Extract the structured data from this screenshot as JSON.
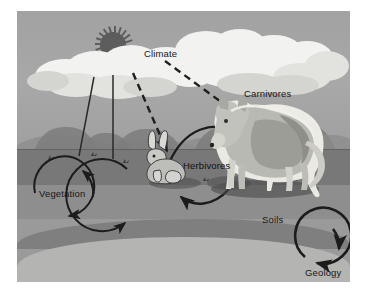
{
  "figure": {
    "background_color": "#ffffff",
    "plate_color": "#9a9a9a"
  },
  "scene": {
    "sky_color": "#a4a4a4",
    "cloud_color": "#f2f2f0",
    "sun_color": "#5a5a5a",
    "arrow_color": "#1c1c1c",
    "strata": [
      {
        "name": "topsoil",
        "color": "#787878"
      },
      {
        "name": "subsoil",
        "color": "#8e8e8e"
      },
      {
        "name": "deep-soil",
        "color": "#7f7f7f"
      },
      {
        "name": "bedrock",
        "color": "#b4b4b2"
      }
    ]
  },
  "labels": {
    "climate": "Climate",
    "carnivores": "Carnivores",
    "herbivores": "Herbivores",
    "vegetation": "Vegetation",
    "soils": "Soils",
    "geology": "Geology"
  },
  "elements": {
    "sun": "sun-icon",
    "cloud": "cloud-icon",
    "wolf": "wolf-icon",
    "rabbit": "rabbit-icon",
    "shrubs": "shrub-icon",
    "vegetation_cycle_arrow": "circular-arrow-icon",
    "herbivore_cycle_arrow": "circular-arrow-icon",
    "geology_cycle_arrow": "circular-arrow-icon",
    "climate_dashed_arrows": "dashed-arrow-icon",
    "rainfall_lines": "vertical-line-icon",
    "food_chain_arrow": "curved-arrow-icon",
    "decomposition_arrow": "curved-arrow-icon"
  }
}
